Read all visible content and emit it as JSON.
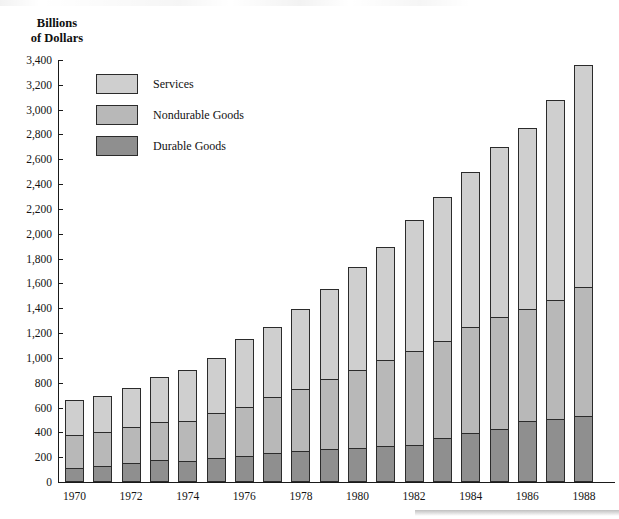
{
  "chart_data": {
    "type": "bar",
    "subtype": "stacked-vertical",
    "title": "",
    "ylabel": "Billions\nof Dollars",
    "xlabel": "",
    "ylim": [
      0,
      3400
    ],
    "ytick_step": 200,
    "grid": false,
    "legend_position": "upper-left-inside",
    "ytick_labels": [
      "0",
      "200",
      "400",
      "600",
      "800",
      "1,000",
      "1,200",
      "1,400",
      "1,600",
      "1,800",
      "2,000",
      "2,200",
      "2,400",
      "2,600",
      "2,800",
      "3,000",
      "3,200",
      "3,400"
    ],
    "ytick_values": [
      0,
      200,
      400,
      600,
      800,
      1000,
      1200,
      1400,
      1600,
      1800,
      2000,
      2200,
      2400,
      2600,
      2800,
      3000,
      3200,
      3400
    ],
    "categories": [
      1970,
      1971,
      1972,
      1973,
      1974,
      1975,
      1976,
      1977,
      1978,
      1979,
      1980,
      1981,
      1982,
      1983,
      1984,
      1985,
      1986,
      1987,
      1988
    ],
    "xtick_labels": [
      "1970",
      "1972",
      "1974",
      "1976",
      "1978",
      "1980",
      "1982",
      "1984",
      "1986",
      "1988"
    ],
    "xtick_values": [
      1970,
      1972,
      1974,
      1976,
      1978,
      1980,
      1982,
      1984,
      1986,
      1988
    ],
    "series": [
      {
        "name": "Durable Goods",
        "color": "#8f8f8f",
        "values": [
          110,
          130,
          150,
          175,
          170,
          190,
          210,
          230,
          250,
          270,
          275,
          290,
          295,
          355,
          395,
          430,
          490,
          510,
          535
        ]
      },
      {
        "name": "Nondurable Goods",
        "color": "#b8b8b8",
        "values": [
          265,
          270,
          290,
          305,
          325,
          365,
          395,
          455,
          500,
          560,
          630,
          695,
          760,
          780,
          855,
          900,
          900,
          960,
          1035
        ]
      },
      {
        "name": "Services",
        "color": "#cfcfcf",
        "values": [
          285,
          290,
          320,
          365,
          410,
          445,
          545,
          560,
          640,
          725,
          830,
          910,
          1055,
          1165,
          1250,
          1370,
          1460,
          1610,
          1790
        ]
      }
    ],
    "totals": [
      660,
      690,
      760,
      845,
      905,
      1000,
      1150,
      1245,
      1390,
      1555,
      1735,
      1895,
      2110,
      2300,
      2500,
      2700,
      2850,
      3080,
      3360
    ],
    "cumulative_tops": {
      "durable": [
        110,
        130,
        150,
        175,
        170,
        190,
        210,
        230,
        250,
        270,
        275,
        290,
        295,
        355,
        395,
        430,
        490,
        510,
        535
      ],
      "nondurable": [
        375,
        400,
        440,
        480,
        495,
        555,
        605,
        685,
        750,
        830,
        905,
        985,
        1055,
        1135,
        1250,
        1330,
        1390,
        1470,
        1570
      ],
      "services": [
        660,
        690,
        760,
        845,
        905,
        1000,
        1150,
        1245,
        1390,
        1555,
        1735,
        1895,
        2110,
        2300,
        2500,
        2700,
        2850,
        3080,
        3360
      ]
    }
  },
  "legend": {
    "items": [
      {
        "label": "Services",
        "color": "#cfcfcf"
      },
      {
        "label": "Nondurable Goods",
        "color": "#b8b8b8"
      },
      {
        "label": "Durable Goods",
        "color": "#8f8f8f"
      }
    ]
  }
}
